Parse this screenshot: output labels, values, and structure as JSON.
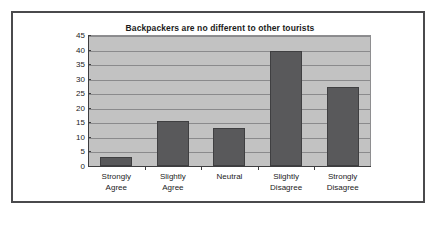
{
  "chart_data": {
    "type": "bar",
    "title": "Backpackers are no different to other tourists",
    "xlabel": "",
    "ylabel": "",
    "categories": [
      "Strongly Agree",
      "Slightly Agree",
      "Neutral",
      "Slightly Disagree",
      "Strongly Disagree"
    ],
    "category_lines": [
      [
        "Strongly",
        "Agree"
      ],
      [
        "Slightly",
        "Agree"
      ],
      [
        "Neutral",
        ""
      ],
      [
        "Slightly",
        "Disagree"
      ],
      [
        "Strongly",
        "Disagree"
      ]
    ],
    "values": [
      3,
      15.5,
      13,
      39.5,
      27
    ],
    "ylim": [
      0,
      45
    ],
    "yticks": [
      0,
      5,
      10,
      15,
      20,
      25,
      30,
      35,
      40,
      45
    ],
    "ytick_labels": [
      "0",
      "5",
      "10",
      "15",
      "20",
      "25",
      "30",
      "35",
      "40",
      "45"
    ],
    "grid": true,
    "legend": false,
    "legend_position": "none",
    "colors": {
      "bar": "#59595b",
      "bar_edge": "#3f3f41",
      "plot_background": "#c2c2c2",
      "gridline": "#8a8a8c",
      "axis": "#3d3d3f",
      "frame": "#4a4a4c",
      "figure_background": "#ffffff",
      "text": "#1b1b1b"
    }
  }
}
